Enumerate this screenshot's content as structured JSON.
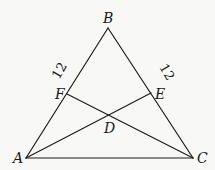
{
  "diagram": {
    "type": "triangle-with-cevians",
    "points": {
      "A": {
        "label": "A",
        "x": 26,
        "y": 158
      },
      "B": {
        "label": "B",
        "x": 108,
        "y": 28
      },
      "C": {
        "label": "C",
        "x": 193,
        "y": 158
      },
      "D": {
        "label": "D",
        "x": 109,
        "y": 116
      },
      "E": {
        "label": "E",
        "x": 151,
        "y": 93
      },
      "F": {
        "label": "F",
        "x": 67,
        "y": 94
      }
    },
    "segments": [
      {
        "name": "AB",
        "from": "A",
        "to": "B"
      },
      {
        "name": "BC",
        "from": "B",
        "to": "C"
      },
      {
        "name": "AC",
        "from": "A",
        "to": "C"
      },
      {
        "name": "AE",
        "from": "A",
        "to": "E"
      },
      {
        "name": "CF",
        "from": "C",
        "to": "F"
      }
    ],
    "measurements": [
      {
        "segment": "BF",
        "label": "12"
      },
      {
        "segment": "BE",
        "label": "12"
      }
    ]
  }
}
